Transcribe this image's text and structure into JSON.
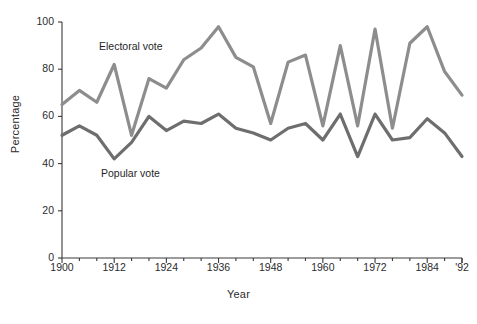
{
  "chart_data": {
    "type": "line",
    "title": "",
    "xlabel": "Year",
    "ylabel": "Percentage",
    "xlim": [
      1900,
      1992
    ],
    "ylim": [
      0,
      100
    ],
    "grid": false,
    "legend_position": "inline-annotation",
    "x": [
      1900,
      1904,
      1908,
      1912,
      1916,
      1920,
      1924,
      1928,
      1932,
      1936,
      1940,
      1944,
      1948,
      1952,
      1956,
      1960,
      1964,
      1968,
      1972,
      1976,
      1980,
      1984,
      1988,
      1992
    ],
    "xtick_values": [
      1900,
      1912,
      1924,
      1936,
      1948,
      1960,
      1972,
      1984,
      1992
    ],
    "xtick_labels": [
      "1900",
      "1912",
      "1924",
      "1936",
      "1948",
      "1960",
      "1972",
      "1984",
      "'92"
    ],
    "ytick_values": [
      0,
      20,
      40,
      60,
      80,
      100
    ],
    "ytick_labels": [
      "0",
      "20",
      "40",
      "60",
      "80",
      "100"
    ],
    "series": [
      {
        "name": "Electoral vote",
        "color": "#8d8d8d",
        "label_text": "Electoral vote",
        "values": [
          65,
          71,
          66,
          82,
          52,
          76,
          72,
          84,
          89,
          98,
          85,
          81,
          57,
          83,
          86,
          56,
          90,
          56,
          97,
          55,
          91,
          98,
          79,
          69
        ]
      },
      {
        "name": "Popular vote",
        "color": "#6e6e6e",
        "label_text": "Popular vote",
        "values": [
          52,
          56,
          52,
          42,
          49,
          60,
          54,
          58,
          57,
          61,
          55,
          53,
          50,
          55,
          57,
          50,
          61,
          43,
          61,
          50,
          51,
          59,
          53,
          43
        ]
      }
    ]
  },
  "axes": {
    "y_title": "Percentage",
    "x_title": "Year"
  }
}
